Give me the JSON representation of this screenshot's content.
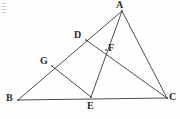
{
  "figure": {
    "type": "geometry-diagram",
    "background_color": "#fefefe",
    "stroke_color": "#3a3a3a",
    "label_color": "#2b2b2b",
    "points": [
      {
        "id": "A",
        "label": "A",
        "x": 122,
        "y": 11,
        "label_x": 116,
        "label_y": 0
      },
      {
        "id": "B",
        "label": "B",
        "x": 18,
        "y": 100,
        "label_x": 6,
        "label_y": 93
      },
      {
        "id": "C",
        "label": "C",
        "x": 167,
        "y": 98,
        "label_x": 169,
        "label_y": 92
      },
      {
        "id": "D",
        "label": "D",
        "x": 86,
        "y": 40,
        "label_x": 74,
        "label_y": 30
      },
      {
        "id": "E",
        "label": "E",
        "x": 91,
        "y": 97,
        "label_x": 87,
        "label_y": 101
      },
      {
        "id": "F",
        "label": "F",
        "x": 106,
        "y": 50,
        "label_x": 108,
        "label_y": 43
      },
      {
        "id": "G",
        "label": "G",
        "x": 52,
        "y": 66,
        "label_x": 40,
        "label_y": 56
      }
    ],
    "segments": [
      {
        "id": "BA",
        "from": "B",
        "to": "A",
        "note": "side BA through G and D"
      },
      {
        "id": "BC",
        "from": "B",
        "to": "C",
        "note": "base BC through E"
      },
      {
        "id": "AC",
        "from": "A",
        "to": "C",
        "note": "side AC"
      },
      {
        "id": "AE",
        "from": "A",
        "to": "E",
        "note": "cevian A to E through F"
      },
      {
        "id": "DC",
        "from": "D",
        "to": "C",
        "note": "cevian D to C through F"
      },
      {
        "id": "GE",
        "from": "G",
        "to": "E",
        "note": "segment G to E"
      }
    ],
    "artifact": {
      "name": "corner-smudge",
      "visible": true
    }
  }
}
